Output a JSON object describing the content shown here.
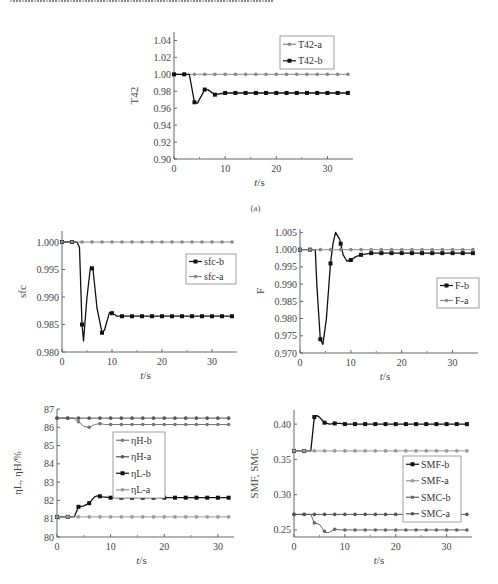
{
  "header_fragment": "Chinese caption text line (cut off at top edge)",
  "chart_data": [
    {
      "id": "a",
      "type": "line",
      "caption": "(a)",
      "xlabel": "t/s",
      "ylabel": "T42",
      "xlim": [
        0,
        35
      ],
      "ylim": [
        0.9,
        1.05
      ],
      "xticks": [
        0,
        10,
        20,
        30
      ],
      "yticks": [
        0.9,
        0.92,
        0.94,
        0.96,
        0.98,
        1.0,
        1.02,
        1.04
      ],
      "ytick_labels": [
        "0.90",
        "0.92",
        "0.94",
        "0.96",
        "0.98",
        "1.00",
        "1.02",
        "1.04"
      ],
      "legend": [
        "T42-a",
        "T42-b"
      ],
      "legend_position": "upper right",
      "series": [
        {
          "name": "T42-a",
          "color": "#888888",
          "x": [
            0,
            2,
            4,
            6,
            8,
            10,
            12,
            14,
            16,
            18,
            20,
            22,
            24,
            26,
            28,
            30,
            32,
            34
          ],
          "y": [
            1.0,
            1.0,
            1.0,
            1.0,
            1.0,
            1.0,
            1.0,
            1.0,
            1.0,
            1.0,
            1.0,
            1.0,
            1.0,
            1.0,
            1.0,
            1.0,
            1.0,
            1.0
          ]
        },
        {
          "name": "T42-b",
          "color": "#111111",
          "x": [
            0,
            3,
            4,
            4.6,
            6,
            6.6,
            8,
            10,
            12,
            14,
            16,
            18,
            20,
            22,
            24,
            26,
            28,
            30,
            32,
            34
          ],
          "y": [
            1.0,
            1.0,
            0.967,
            0.966,
            0.982,
            0.982,
            0.976,
            0.978,
            0.978,
            0.978,
            0.978,
            0.978,
            0.978,
            0.978,
            0.978,
            0.978,
            0.978,
            0.978,
            0.978,
            0.978
          ]
        }
      ]
    },
    {
      "id": "sfc",
      "type": "line",
      "xlabel": "t/s",
      "ylabel": "sfc",
      "xlim": [
        0,
        35
      ],
      "ylim": [
        0.98,
        1.002
      ],
      "xticks": [
        0,
        10,
        20,
        30
      ],
      "yticks": [
        0.98,
        0.985,
        0.99,
        0.995,
        1.0
      ],
      "ytick_labels": [
        "0.980",
        "0.985",
        "0.990",
        "0.995",
        "1.000"
      ],
      "legend": [
        "sfc-b",
        "sfc-a"
      ],
      "legend_position": "right",
      "series": [
        {
          "name": "sfc-b",
          "color": "#111111",
          "x": [
            0,
            3,
            3.5,
            4,
            4.3,
            5,
            5.7,
            6.2,
            7,
            8,
            8.5,
            9.5,
            10.2,
            11,
            12,
            14,
            16,
            18,
            20,
            22,
            24,
            26,
            28,
            30,
            32,
            34
          ],
          "y": [
            1.0,
            1.0,
            0.999,
            0.985,
            0.982,
            0.99,
            0.9955,
            0.995,
            0.988,
            0.9835,
            0.984,
            0.9872,
            0.987,
            0.9865,
            0.9865,
            0.9865,
            0.9865,
            0.9865,
            0.9865,
            0.9865,
            0.9865,
            0.9865,
            0.9865,
            0.9865,
            0.9865,
            0.9865
          ]
        },
        {
          "name": "sfc-a",
          "color": "#888888",
          "x": [
            0,
            2,
            4,
            6,
            8,
            10,
            12,
            14,
            16,
            18,
            20,
            22,
            24,
            26,
            28,
            30,
            32,
            34
          ],
          "y": [
            1.0,
            1.0,
            1.0,
            1.0,
            1.0,
            1.0,
            1.0,
            1.0,
            1.0,
            1.0,
            1.0,
            1.0,
            1.0,
            1.0,
            1.0,
            1.0,
            1.0,
            1.0
          ]
        }
      ]
    },
    {
      "id": "F",
      "type": "line",
      "xlabel": "t/s",
      "ylabel": "F",
      "xlim": [
        0,
        35
      ],
      "ylim": [
        0.97,
        1.006
      ],
      "xticks": [
        0,
        10,
        20,
        30
      ],
      "yticks": [
        0.97,
        0.975,
        0.98,
        0.985,
        0.99,
        0.995,
        1.0,
        1.005
      ],
      "ytick_labels": [
        "0.970",
        "0.975",
        "0.980",
        "0.985",
        "0.990",
        "0.995",
        "1.000",
        "1.005"
      ],
      "legend": [
        "F-b",
        "F-a"
      ],
      "legend_position": "right",
      "series": [
        {
          "name": "F-b",
          "color": "#111111",
          "x": [
            0,
            3,
            3.3,
            4,
            4.5,
            5.2,
            6,
            6.5,
            7,
            7.8,
            8.5,
            9.2,
            10,
            11,
            12,
            14,
            16,
            18,
            20,
            22,
            24,
            26,
            28,
            30,
            32,
            34
          ],
          "y": [
            1.0,
            1.0,
            0.99,
            0.974,
            0.9725,
            0.98,
            0.996,
            1.002,
            1.005,
            1.003,
            0.9985,
            0.9967,
            0.997,
            0.998,
            0.9985,
            0.999,
            0.999,
            0.999,
            0.999,
            0.999,
            0.999,
            0.999,
            0.999,
            0.999,
            0.999,
            0.999
          ]
        },
        {
          "name": "F-a",
          "color": "#888888",
          "x": [
            0,
            2,
            4,
            6,
            8,
            10,
            12,
            14,
            16,
            18,
            20,
            22,
            24,
            26,
            28,
            30,
            32,
            34
          ],
          "y": [
            1.0,
            1.0,
            1.0,
            1.0,
            1.0,
            1.0,
            1.0,
            1.0,
            1.0,
            1.0,
            1.0,
            1.0,
            1.0,
            1.0,
            1.0,
            1.0,
            1.0,
            1.0
          ]
        }
      ]
    },
    {
      "id": "eta",
      "type": "line",
      "xlabel": "t/s",
      "ylabel": "ηL, ηH/%",
      "xlim": [
        0,
        33
      ],
      "ylim": [
        80,
        87
      ],
      "xticks": [
        0,
        10,
        20,
        30
      ],
      "yticks": [
        80,
        81,
        82,
        83,
        84,
        85,
        86,
        87
      ],
      "ytick_labels": [
        "80",
        "81",
        "82",
        "83",
        "84",
        "85",
        "86",
        "87"
      ],
      "legend": [
        "ηH-b",
        "ηH-a",
        "ηL-b",
        "ηL-a"
      ],
      "legend_position": "center",
      "series": [
        {
          "name": "ηH-b",
          "color": "#777777",
          "x": [
            0,
            2,
            3,
            4,
            5,
            6,
            7,
            8,
            9,
            10,
            12,
            14,
            16,
            18,
            20,
            22,
            24,
            26,
            28,
            30,
            32
          ],
          "y": [
            86.5,
            86.5,
            86.5,
            86.3,
            86.05,
            86.0,
            86.15,
            86.2,
            86.15,
            86.15,
            86.15,
            86.15,
            86.15,
            86.15,
            86.15,
            86.15,
            86.15,
            86.15,
            86.15,
            86.15,
            86.15
          ]
        },
        {
          "name": "ηH-a",
          "color": "#555555",
          "x": [
            0,
            2,
            4,
            6,
            8,
            10,
            12,
            14,
            16,
            18,
            20,
            22,
            24,
            26,
            28,
            30,
            32
          ],
          "y": [
            86.5,
            86.5,
            86.5,
            86.5,
            86.5,
            86.5,
            86.5,
            86.5,
            86.5,
            86.5,
            86.5,
            86.5,
            86.5,
            86.5,
            86.5,
            86.5,
            86.5
          ]
        },
        {
          "name": "ηL-b",
          "color": "#111111",
          "x": [
            0,
            2,
            3.2,
            4,
            5,
            6,
            7,
            7.5,
            8.5,
            10,
            12,
            14,
            16,
            18,
            20,
            22,
            24,
            26,
            28,
            30,
            32
          ],
          "y": [
            81.1,
            81.1,
            81.1,
            81.65,
            81.7,
            81.85,
            82.2,
            82.25,
            82.2,
            82.15,
            82.15,
            82.15,
            82.15,
            82.15,
            82.15,
            82.15,
            82.15,
            82.15,
            82.15,
            82.15,
            82.15
          ]
        },
        {
          "name": "ηL-a",
          "color": "#999999",
          "x": [
            0,
            2,
            4,
            6,
            8,
            10,
            12,
            14,
            16,
            18,
            20,
            22,
            24,
            26,
            28,
            30,
            32
          ],
          "y": [
            81.1,
            81.1,
            81.1,
            81.1,
            81.1,
            81.1,
            81.1,
            81.1,
            81.1,
            81.1,
            81.1,
            81.1,
            81.1,
            81.1,
            81.1,
            81.1,
            81.1
          ]
        }
      ]
    },
    {
      "id": "SM",
      "type": "line",
      "xlabel": "t/s",
      "ylabel": "SMF, SMC",
      "xlim": [
        0,
        35
      ],
      "ylim": [
        0.24,
        0.42
      ],
      "xticks": [
        0,
        10,
        20,
        30
      ],
      "yticks": [
        0.25,
        0.3,
        0.35,
        0.4
      ],
      "ytick_labels": [
        "0.25",
        "0.30",
        "0.35",
        "0.40"
      ],
      "legend": [
        "SMF-b",
        "SMF-a",
        "SMC-b",
        "SMC-a"
      ],
      "legend_position": "right",
      "series": [
        {
          "name": "SMF-b",
          "color": "#111111",
          "x": [
            0,
            2,
            3.3,
            4,
            4.5,
            5,
            6,
            7,
            8,
            9,
            10,
            12,
            14,
            16,
            18,
            20,
            22,
            24,
            26,
            28,
            30,
            32,
            34
          ],
          "y": [
            0.362,
            0.362,
            0.362,
            0.41,
            0.412,
            0.41,
            0.402,
            0.4,
            0.401,
            0.401,
            0.4,
            0.4,
            0.4,
            0.4,
            0.4,
            0.4,
            0.4,
            0.4,
            0.4,
            0.4,
            0.4,
            0.4,
            0.4
          ]
        },
        {
          "name": "SMF-a",
          "color": "#999999",
          "x": [
            0,
            2,
            4,
            6,
            8,
            10,
            12,
            14,
            16,
            18,
            20,
            22,
            24,
            26,
            28,
            30,
            32,
            34
          ],
          "y": [
            0.362,
            0.362,
            0.362,
            0.362,
            0.362,
            0.362,
            0.362,
            0.362,
            0.362,
            0.362,
            0.362,
            0.362,
            0.362,
            0.362,
            0.362,
            0.362,
            0.362,
            0.362
          ]
        },
        {
          "name": "SMC-b",
          "color": "#666666",
          "x": [
            0,
            2,
            3.3,
            4,
            5,
            6,
            6.5,
            7,
            8,
            9,
            10,
            12,
            14,
            16,
            18,
            20,
            22,
            24,
            26,
            28,
            30,
            32,
            34
          ],
          "y": [
            0.272,
            0.272,
            0.272,
            0.26,
            0.258,
            0.248,
            0.246,
            0.247,
            0.251,
            0.25,
            0.25,
            0.25,
            0.25,
            0.25,
            0.25,
            0.25,
            0.25,
            0.25,
            0.25,
            0.25,
            0.25,
            0.25,
            0.25
          ]
        },
        {
          "name": "SMC-a",
          "color": "#555555",
          "x": [
            0,
            2,
            4,
            6,
            8,
            10,
            12,
            14,
            16,
            18,
            20,
            22,
            24,
            26,
            28,
            30,
            32,
            34
          ],
          "y": [
            0.272,
            0.272,
            0.272,
            0.272,
            0.272,
            0.272,
            0.272,
            0.272,
            0.272,
            0.272,
            0.272,
            0.272,
            0.272,
            0.272,
            0.272,
            0.272,
            0.272,
            0.272
          ]
        }
      ]
    }
  ],
  "layout": {
    "a": {
      "x0": 174,
      "x1": 353,
      "y0": 159,
      "y1": 32,
      "legend": {
        "x": 280,
        "y": 36,
        "w": 54,
        "h": 33
      }
    },
    "sfc": {
      "x0": 62,
      "x1": 237,
      "y0": 352,
      "y1": 231,
      "legend": {
        "x": 186,
        "y": 254,
        "w": 50,
        "h": 30
      }
    },
    "F": {
      "x0": 300,
      "x1": 478,
      "y0": 353,
      "y1": 229,
      "legend": {
        "x": 437,
        "y": 278,
        "w": 42,
        "h": 30
      }
    },
    "eta": {
      "x0": 57,
      "x1": 234,
      "y0": 537,
      "y1": 409,
      "legend": {
        "x": 113,
        "y": 432,
        "w": 52,
        "h": 66
      }
    },
    "SM": {
      "x0": 294,
      "x1": 472,
      "y0": 537,
      "y1": 410,
      "legend": {
        "x": 403,
        "y": 456,
        "w": 58,
        "h": 66
      }
    }
  }
}
